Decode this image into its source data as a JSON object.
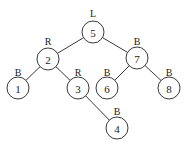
{
  "diagram": {
    "type": "binary-tree",
    "nodes": [
      {
        "id": "5",
        "label": "5",
        "tag": "L",
        "x": 93,
        "y": 32,
        "tagY": 13
      },
      {
        "id": "2",
        "label": "2",
        "tag": "R",
        "x": 48,
        "y": 59,
        "tagY": 41
      },
      {
        "id": "7",
        "label": "7",
        "tag": "B",
        "x": 137,
        "y": 58,
        "tagY": 41
      },
      {
        "id": "1",
        "label": "1",
        "tag": "B",
        "x": 18,
        "y": 88,
        "tagY": 72
      },
      {
        "id": "3",
        "label": "3",
        "tag": "R",
        "x": 78,
        "y": 88,
        "tagY": 72
      },
      {
        "id": "6",
        "label": "6",
        "tag": "B",
        "x": 107,
        "y": 88,
        "tagY": 72
      },
      {
        "id": "8",
        "label": "8",
        "tag": "B",
        "x": 169,
        "y": 88,
        "tagY": 72
      },
      {
        "id": "4",
        "label": "4",
        "tag": "B",
        "x": 117,
        "y": 128,
        "tagY": 111
      }
    ],
    "edges": [
      {
        "from": "5",
        "to": "2"
      },
      {
        "from": "5",
        "to": "7"
      },
      {
        "from": "2",
        "to": "1"
      },
      {
        "from": "2",
        "to": "3"
      },
      {
        "from": "3",
        "to": "4"
      },
      {
        "from": "7",
        "to": "6"
      },
      {
        "from": "7",
        "to": "8"
      }
    ],
    "node_radius": 11
  }
}
